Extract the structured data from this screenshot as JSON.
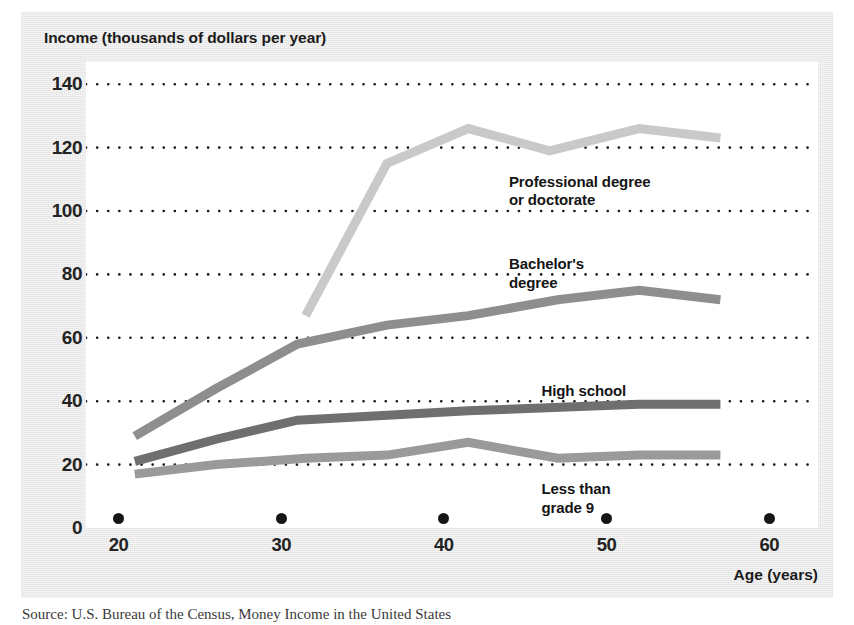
{
  "figure": {
    "y_axis_title": "Income (thousands of dollars per year)",
    "x_axis_title": "Age (years)",
    "source_note": "Source: U.S. Bureau of the Census, Money Income in the United States"
  },
  "colors": {
    "panel": "#e3e3e3",
    "plot_background": "#ffffff",
    "gridline": "#1a1a1a",
    "professional": "#c9c9c9",
    "bachelors": "#8e8e8e",
    "high_school": "#6f6f6f",
    "less_than_grade_9": "#9a9a9a",
    "text": "#1b1b1b"
  },
  "chart_data": {
    "type": "line",
    "title": "Income (thousands of dollars per year)",
    "xlabel": "Age (years)",
    "ylabel": "Income (thousands of dollars per year)",
    "xlim": [
      18,
      63
    ],
    "ylim": [
      0,
      147
    ],
    "xticks": [
      20,
      30,
      40,
      50,
      60
    ],
    "yticks": [
      0,
      20,
      40,
      60,
      80,
      100,
      120,
      140
    ],
    "grid": "horizontal dotted gridlines at each y tick",
    "legend": "inline labels placed next to each curve",
    "series": [
      {
        "name": "Professional degree or doctorate",
        "color": "#c9c9c9",
        "points": [
          [
            31.5,
            67
          ],
          [
            36.5,
            115
          ],
          [
            41.5,
            126
          ],
          [
            46.5,
            119
          ],
          [
            52.0,
            126
          ],
          [
            57.0,
            123
          ]
        ]
      },
      {
        "name": "Bachelor's degree",
        "color": "#8e8e8e",
        "points": [
          [
            21.0,
            29
          ],
          [
            26.0,
            44
          ],
          [
            31.0,
            58
          ],
          [
            36.5,
            64
          ],
          [
            41.5,
            67
          ],
          [
            47.0,
            72
          ],
          [
            52.0,
            75
          ],
          [
            57.0,
            72
          ]
        ]
      },
      {
        "name": "High school",
        "color": "#6f6f6f",
        "points": [
          [
            21.0,
            21
          ],
          [
            26.0,
            28
          ],
          [
            31.0,
            34
          ],
          [
            41.5,
            37
          ],
          [
            52.0,
            39
          ],
          [
            57.0,
            39
          ]
        ]
      },
      {
        "name": "Less than grade 9",
        "color": "#9a9a9a",
        "points": [
          [
            21.0,
            17
          ],
          [
            26.0,
            20
          ],
          [
            31.5,
            22
          ],
          [
            36.5,
            23
          ],
          [
            41.5,
            27
          ],
          [
            47.0,
            22
          ],
          [
            52.0,
            23
          ],
          [
            57.0,
            23
          ]
        ]
      }
    ],
    "annotations": [
      {
        "text": "Professional degree\nor doctorate",
        "x": 44.0,
        "y": 112
      },
      {
        "text": "Bachelor's\ndegree",
        "x": 44.0,
        "y": 86
      },
      {
        "text": "High school",
        "x": 46.0,
        "y": 46
      },
      {
        "text": "Less than\ngrade 9",
        "x": 46.0,
        "y": 15
      }
    ]
  }
}
